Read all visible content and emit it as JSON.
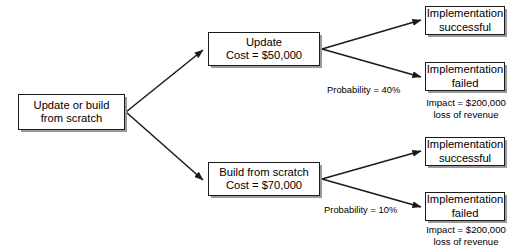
{
  "diagram": {
    "root": {
      "line1": "Update or build",
      "line2": "from scratch"
    },
    "options": [
      {
        "line1": "Update",
        "line2": "Cost = $50,000",
        "probability_label": "Probability = 40%",
        "outcomes": [
          {
            "line1": "Implementation",
            "line2": "successful"
          },
          {
            "line1": "Implementation",
            "line2": "failed"
          }
        ],
        "impact": {
          "line1": "Impact = $200,000",
          "line2": "loss of revenue"
        }
      },
      {
        "line1": "Build from scratch",
        "line2": "Cost = $70,000",
        "probability_label": "Probability = 10%",
        "outcomes": [
          {
            "line1": "Implementation",
            "line2": "successful"
          },
          {
            "line1": "Implementation",
            "line2": "failed"
          }
        ],
        "impact": {
          "line1": "Impact = $200,000",
          "line2": "loss of revenue"
        }
      }
    ],
    "colors": {
      "stroke": "#1a1a1a",
      "background": "#ffffff",
      "text": "#000000",
      "shadow": "#9a9a9a"
    }
  }
}
